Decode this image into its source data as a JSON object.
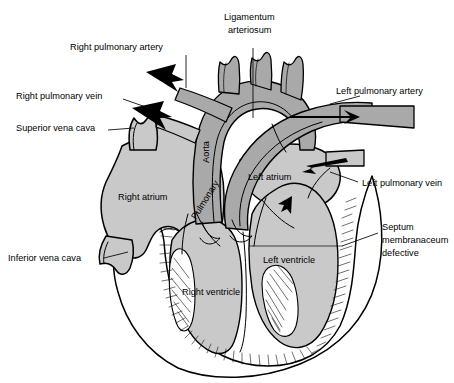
{
  "figure": {
    "background_color": "#ffffff",
    "chamber_fill": "#c9c9c9",
    "vessel_fill": "#a9a9a9",
    "myocardium_fill": "#ffffff",
    "outline_color": "#000000",
    "label_color": "#000000"
  },
  "labels": {
    "right_pulmonary_artery": "Right pulmonary artery",
    "right_pulmonary_vein": "Right pulmonary vein",
    "superior_vena_cava": "Superior vena cava",
    "inferior_vena_cava": "Inferior vena cava",
    "ligamentum_arteriosum_line1": "Ligamentum",
    "ligamentum_arteriosum_line2": "arteriosum",
    "left_pulmonary_artery": "Left pulmonary artery",
    "left_pulmonary_vein": "Left pulmonary vein",
    "septum_line1": "Septum",
    "septum_line2": "membranaceum",
    "septum_line3": "defective",
    "right_atrium": "Right atrium",
    "left_atrium": "Left atrium",
    "right_ventricle": "Right ventricle",
    "left_ventricle": "Left ventricle",
    "aorta": "Aorta",
    "pulmonary": "Pulmonary"
  }
}
